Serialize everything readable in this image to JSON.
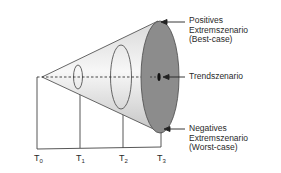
{
  "diagram": {
    "type": "scenario-funnel",
    "annotations": {
      "best_case": {
        "line1": "Positives",
        "line2": "Extremszenario",
        "line3": "(Best-case)"
      },
      "trend": {
        "line1": "Trendszenario"
      },
      "worst_case": {
        "line1": "Negatives",
        "line2": "Extremszenario",
        "line3": "(Worst-case)"
      }
    },
    "time_axis": [
      {
        "base": "T",
        "sub": "0"
      },
      {
        "base": "T",
        "sub": "1"
      },
      {
        "base": "T",
        "sub": "2"
      },
      {
        "base": "T",
        "sub": "3"
      }
    ],
    "colors": {
      "cone_light": "#f4f4f4",
      "cone_shade": "#c8c8c8",
      "disc_fill": "#8a8a8a",
      "outline": "#555555",
      "marker": "#111111"
    }
  }
}
